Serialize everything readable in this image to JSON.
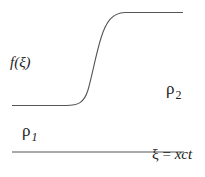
{
  "diagram": {
    "function_label": "f(ξ)",
    "region_right": {
      "symbol": "ρ",
      "subscript": "2"
    },
    "region_left": {
      "symbol": "ρ",
      "subscript": "1"
    },
    "axis_label": {
      "lhs": "ξ",
      "eq": " = ",
      "rhs": "xct"
    },
    "stroke_color": "#555555"
  }
}
